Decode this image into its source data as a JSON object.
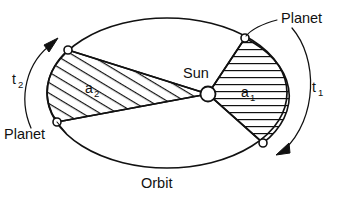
{
  "figure": {
    "type": "diagram",
    "background_color": "#ffffff",
    "line_color": "#111111",
    "width": 339,
    "height": 200
  },
  "labels": {
    "sun": "Sun",
    "orbit": "Orbit",
    "planet_left": "Planet",
    "planet_right": "Planet",
    "area_1_base": "a",
    "area_1_sub": "1",
    "area_2_base": "a",
    "area_2_sub": "2",
    "time_1_base": "t",
    "time_1_sub": "1",
    "time_2_base": "t",
    "time_2_sub": "2"
  },
  "geometry": {
    "orbit_ellipse": {
      "center_x": 167,
      "center_y": 93,
      "radius_x": 120,
      "radius_y": 75
    },
    "sun": {
      "center_x": 208,
      "center_y": 94,
      "radius": 7.5
    },
    "planet_markers": [
      {
        "name": "marker-top-right",
        "x": 245,
        "y": 38,
        "radius": 4
      },
      {
        "name": "marker-bottom-right",
        "x": 263,
        "y": 143,
        "radius": 4
      },
      {
        "name": "marker-top-left",
        "x": 68,
        "y": 50,
        "radius": 4
      },
      {
        "name": "marker-bottom-left",
        "x": 57,
        "y": 122,
        "radius": 4
      }
    ]
  },
  "sectors": {
    "a1": {
      "name": "swept-area-near-sun",
      "hatch": "horizontal",
      "description": "Small fast sweep near perihelion, bounded by Sun and two planet positions on the right limb"
    },
    "a2": {
      "name": "swept-area-far-sun",
      "hatch": "diagonal",
      "description": "Long slow sweep near aphelion, bounded by Sun and two planet positions on the left limb"
    }
  },
  "arrows": {
    "t1_direction": "clockwise-down-left",
    "t2_direction": "counterclockwise-up-right"
  }
}
